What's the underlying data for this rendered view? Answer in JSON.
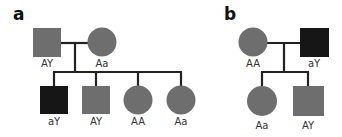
{
  "diagram": {
    "type": "pedigree",
    "colors": {
      "affected": "#161616",
      "unaffected": "#6e6e6e",
      "line": "#222222",
      "label": "#333333"
    },
    "panels": [
      {
        "id": "a",
        "label": "a",
        "parents": [
          {
            "sex": "male",
            "shape": "square",
            "genotype": "AY",
            "affected": false
          },
          {
            "sex": "female",
            "shape": "circle",
            "genotype": "Aa",
            "affected": false
          }
        ],
        "children": [
          {
            "sex": "male",
            "shape": "square",
            "genotype": "aY",
            "affected": true
          },
          {
            "sex": "male",
            "shape": "square",
            "genotype": "AY",
            "affected": false
          },
          {
            "sex": "female",
            "shape": "circle",
            "genotype": "AA",
            "affected": false
          },
          {
            "sex": "female",
            "shape": "circle",
            "genotype": "Aa",
            "affected": false
          }
        ]
      },
      {
        "id": "b",
        "label": "b",
        "parents": [
          {
            "sex": "female",
            "shape": "circle",
            "genotype": "AA",
            "affected": false
          },
          {
            "sex": "male",
            "shape": "square",
            "genotype": "aY",
            "affected": true
          }
        ],
        "children": [
          {
            "sex": "female",
            "shape": "circle",
            "genotype": "Aa",
            "affected": false
          },
          {
            "sex": "male",
            "shape": "square",
            "genotype": "AY",
            "affected": false
          }
        ]
      }
    ]
  }
}
